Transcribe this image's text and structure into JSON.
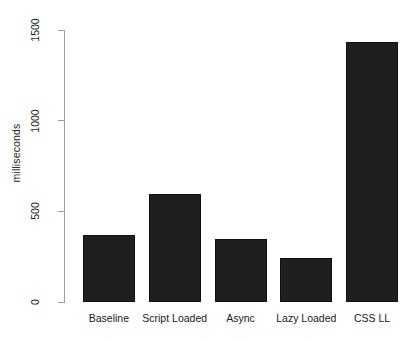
{
  "chart_data": {
    "type": "bar",
    "title": "",
    "subtitle": "",
    "xlabel": "",
    "ylabel": "milliseconds",
    "categories": [
      "Baseline",
      "Script Loaded",
      "Async",
      "Lazy Loaded",
      "CSS LL"
    ],
    "values": [
      372,
      595,
      350,
      240,
      1433
    ],
    "series": [
      {
        "name": "milliseconds",
        "values": [
          372,
          595,
          350,
          240,
          1433
        ]
      }
    ],
    "ylim": [
      0,
      1500
    ],
    "y_ticks": [
      0,
      500,
      1000,
      1500
    ],
    "y_tick_labels": [
      "0",
      "500",
      "1000",
      "1500"
    ],
    "x_tick_labels": [
      "Baseline",
      "Script Loaded",
      "Async",
      "Lazy Loaded",
      "CSS LL"
    ],
    "grid": false,
    "legend": false,
    "legend_position": "none",
    "annotations": [],
    "bar_color": "#1f1f1f",
    "bar_border_color": "#111111",
    "axis_color": "#9b9b9b",
    "background_color": "#ffffff",
    "text_color": "#1a1a1a",
    "y_tick_label_rotation": "vertical",
    "x_tick_label_rotation": "horizontal"
  }
}
